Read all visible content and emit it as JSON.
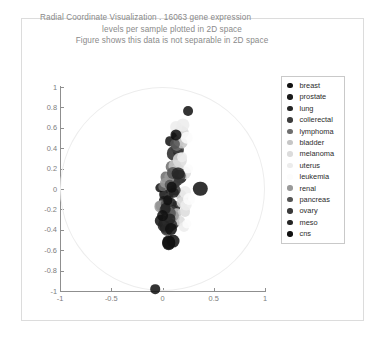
{
  "chart_data": {
    "type": "scatter",
    "title": "Radial Coordinate Visualization . 16063 gene expression levels per sample plotted in 2D space Figure shows this data is not separable in 2D space",
    "title_lines": [
      "Radial Coordinate Visualization . 16063 gene expression",
      "levels per sample plotted in 2D space",
      "Figure shows this data is not separable in 2D space"
    ],
    "xlabel": "",
    "ylabel": "",
    "xlim": [
      -1,
      1
    ],
    "ylim": [
      -1,
      1
    ],
    "grid": false,
    "legend_position": "right",
    "annotations": [
      "faint unit circle drawn as the radviz anchor boundary"
    ],
    "xticks": [
      "-1",
      "-0.5",
      "0",
      "0.5",
      "1"
    ],
    "xtick_values": [
      -1,
      -0.5,
      0,
      0.5,
      1
    ],
    "yticks": [
      "1",
      "0.8",
      "0.6",
      "0.4",
      "0.2",
      "0",
      "-0.2",
      "-0.4",
      "-0.6",
      "-0.8",
      "-1"
    ],
    "ytick_values": [
      1,
      0.8,
      0.6,
      0.4,
      0.2,
      0,
      -0.2,
      -0.4,
      -0.6,
      -0.8,
      -1
    ],
    "legend_entries": [
      {
        "label": "breast",
        "color": "#111111"
      },
      {
        "label": "prostate",
        "color": "#1a1a1a"
      },
      {
        "label": "lung",
        "color": "#262626"
      },
      {
        "label": "collerectal",
        "color": "#3d3d3d"
      },
      {
        "label": "lymphoma",
        "color": "#6e6e6e"
      },
      {
        "label": "bladder",
        "color": "#c6c6c6"
      },
      {
        "label": "melanoma",
        "color": "#dcdcdc"
      },
      {
        "label": "uterus",
        "color": "#ececec"
      },
      {
        "label": "leukemia",
        "color": "#fcfcfc"
      },
      {
        "label": "renal",
        "color": "#9a9a9a"
      },
      {
        "label": "pancreas",
        "color": "#555555"
      },
      {
        "label": "ovary",
        "color": "#3a3a3a"
      },
      {
        "label": "meso",
        "color": "#242424"
      },
      {
        "label": "cns",
        "color": "#101010"
      }
    ],
    "series": [
      {
        "name": "breast",
        "color": "#111111",
        "points": [
          [
            0.25,
            0.76
          ],
          [
            0.37,
            0.0
          ],
          [
            0.07,
            0.47
          ],
          [
            0.14,
            0.52
          ],
          [
            -0.02,
            0.01
          ],
          [
            0.01,
            -0.05
          ],
          [
            0.04,
            -0.27
          ],
          [
            0.06,
            -0.52
          ],
          [
            0.1,
            -0.51
          ],
          [
            0.02,
            -0.34
          ],
          [
            -0.01,
            -0.31
          ],
          [
            -0.07,
            -0.98
          ]
        ]
      },
      {
        "name": "prostate",
        "color": "#1a1a1a",
        "points": [
          [
            0.13,
            0.14
          ],
          [
            0.17,
            0.12
          ],
          [
            0.09,
            -0.14
          ],
          [
            0.04,
            -0.17
          ],
          [
            0.01,
            -0.12
          ],
          [
            0.07,
            -0.36
          ],
          [
            0.03,
            -0.38
          ]
        ]
      },
      {
        "name": "lung",
        "color": "#262626",
        "points": [
          [
            0.15,
            0.36
          ],
          [
            0.11,
            0.35
          ],
          [
            0.12,
            0.06
          ],
          [
            0.08,
            -0.02
          ],
          [
            0.05,
            -0.19
          ],
          [
            0.1,
            -0.21
          ],
          [
            0.13,
            -0.17
          ],
          [
            0.02,
            -0.3
          ]
        ]
      },
      {
        "name": "collerectal",
        "color": "#3d3d3d",
        "points": [
          [
            0.13,
            0.4
          ],
          [
            0.16,
            0.38
          ],
          [
            0.1,
            0.1
          ],
          [
            0.14,
            0.09
          ],
          [
            0.06,
            -0.08
          ],
          [
            0.09,
            -0.22
          ],
          [
            0.05,
            -0.25
          ],
          [
            0.11,
            -0.33
          ]
        ]
      },
      {
        "name": "lymphoma",
        "color": "#6e6e6e",
        "points": [
          [
            0.14,
            0.42
          ],
          [
            0.09,
            0.22
          ],
          [
            0.03,
            0.12
          ],
          [
            0.0,
            0.02
          ],
          [
            -0.01,
            -0.17
          ],
          [
            0.04,
            -0.2
          ],
          [
            0.12,
            -0.28
          ]
        ]
      },
      {
        "name": "bladder",
        "color": "#c6c6c6",
        "points": [
          [
            0.19,
            0.45
          ],
          [
            0.16,
            0.47
          ],
          [
            0.12,
            0.23
          ],
          [
            0.15,
            0.19
          ],
          [
            0.18,
            -0.06
          ],
          [
            0.2,
            -0.09
          ],
          [
            0.14,
            -0.24
          ]
        ]
      },
      {
        "name": "melanoma",
        "color": "#dcdcdc",
        "points": [
          [
            0.18,
            0.57
          ],
          [
            0.2,
            0.55
          ],
          [
            0.17,
            0.28
          ],
          [
            0.21,
            0.16
          ],
          [
            0.19,
            -0.13
          ],
          [
            0.22,
            -0.22
          ],
          [
            0.17,
            -0.31
          ]
        ]
      },
      {
        "name": "uterus",
        "color": "#ececec",
        "points": [
          [
            0.2,
            0.63
          ],
          [
            0.13,
            0.61
          ],
          [
            0.19,
            0.31
          ],
          [
            0.22,
            -0.03
          ],
          [
            0.23,
            -0.16
          ],
          [
            0.21,
            -0.37
          ]
        ]
      },
      {
        "name": "leukemia",
        "color": "#fcfcfc",
        "points": [
          [
            0.24,
            0.5
          ],
          [
            0.25,
            0.2
          ],
          [
            0.26,
            -0.1
          ],
          [
            0.24,
            -0.34
          ]
        ]
      },
      {
        "name": "renal",
        "color": "#9a9a9a",
        "points": [
          [
            0.07,
            0.12
          ],
          [
            0.02,
            0.06
          ],
          [
            -0.02,
            -0.17
          ],
          [
            0.06,
            -0.23
          ],
          [
            0.11,
            -0.26
          ],
          [
            0.08,
            -0.3
          ]
        ]
      },
      {
        "name": "pancreas",
        "color": "#555555",
        "points": [
          [
            0.12,
            0.44
          ],
          [
            0.1,
            0.16
          ],
          [
            0.07,
            0.04
          ],
          [
            0.03,
            -0.15
          ],
          [
            0.08,
            -0.24
          ],
          [
            0.05,
            -0.32
          ]
        ]
      },
      {
        "name": "ovary",
        "color": "#3a3a3a",
        "points": [
          [
            0.16,
            0.13
          ],
          [
            0.12,
            -0.01
          ],
          [
            0.06,
            -0.13
          ],
          [
            0.02,
            -0.21
          ],
          [
            0.09,
            -0.35
          ],
          [
            0.04,
            -0.4
          ]
        ]
      },
      {
        "name": "meso",
        "color": "#242424",
        "points": [
          [
            0.15,
            0.15
          ],
          [
            0.11,
            -0.04
          ],
          [
            0.03,
            -0.19
          ],
          [
            0.07,
            -0.29
          ],
          [
            0.01,
            -0.36
          ]
        ]
      },
      {
        "name": "cns",
        "color": "#101010",
        "points": [
          [
            0.13,
            0.53
          ],
          [
            0.09,
            0.02
          ],
          [
            0.05,
            -0.11
          ],
          [
            0.0,
            -0.26
          ],
          [
            0.08,
            -0.39
          ],
          [
            0.06,
            -0.53
          ]
        ]
      }
    ]
  }
}
